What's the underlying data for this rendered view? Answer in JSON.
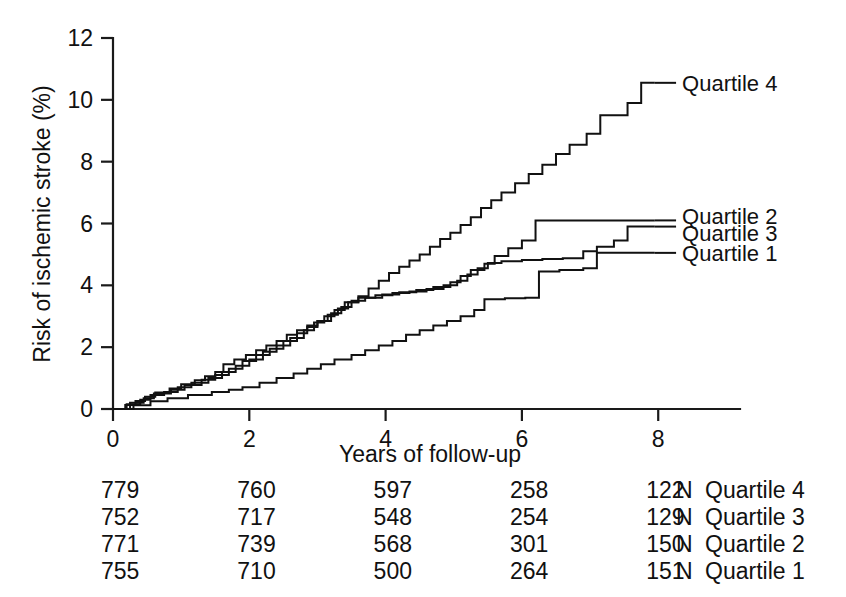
{
  "chart_data": {
    "type": "line",
    "title": "",
    "xlabel": "Years of follow-up",
    "ylabel": "Risk of ischemic stroke (%)",
    "xlim": [
      0,
      9.2
    ],
    "ylim": [
      0,
      12
    ],
    "xticks": [
      0,
      2,
      4,
      6,
      8
    ],
    "xtick_labels": [
      "0",
      "2",
      "4",
      "6",
      "8"
    ],
    "yticks": [
      0,
      2,
      4,
      6,
      8,
      10,
      12
    ],
    "ytick_labels": [
      "0",
      "2",
      "4",
      "6",
      "8",
      "10",
      "12"
    ],
    "grid": false,
    "legend_position": "right-inline",
    "series": [
      {
        "name": "Quartile 4",
        "label": "Quartile 4",
        "label_x": 8.35,
        "label_y": 10.55,
        "points": [
          [
            0.0,
            0.0
          ],
          [
            0.18,
            0.13
          ],
          [
            0.33,
            0.26
          ],
          [
            0.47,
            0.4
          ],
          [
            0.62,
            0.53
          ],
          [
            0.83,
            0.66
          ],
          [
            1.0,
            0.8
          ],
          [
            1.2,
            0.93
          ],
          [
            1.35,
            1.06
          ],
          [
            1.5,
            1.2
          ],
          [
            1.62,
            1.45
          ],
          [
            1.78,
            1.6
          ],
          [
            1.95,
            1.75
          ],
          [
            2.1,
            1.9
          ],
          [
            2.25,
            2.05
          ],
          [
            2.4,
            2.2
          ],
          [
            2.55,
            2.4
          ],
          [
            2.7,
            2.55
          ],
          [
            2.85,
            2.7
          ],
          [
            3.0,
            2.85
          ],
          [
            3.15,
            3.05
          ],
          [
            3.3,
            3.25
          ],
          [
            3.45,
            3.45
          ],
          [
            3.6,
            3.65
          ],
          [
            3.75,
            3.9
          ],
          [
            3.9,
            4.15
          ],
          [
            4.05,
            4.4
          ],
          [
            4.2,
            4.6
          ],
          [
            4.35,
            4.8
          ],
          [
            4.5,
            5.0
          ],
          [
            4.65,
            5.25
          ],
          [
            4.8,
            5.5
          ],
          [
            4.95,
            5.7
          ],
          [
            5.1,
            5.95
          ],
          [
            5.25,
            6.2
          ],
          [
            5.4,
            6.5
          ],
          [
            5.55,
            6.75
          ],
          [
            5.7,
            7.0
          ],
          [
            5.9,
            7.3
          ],
          [
            6.1,
            7.6
          ],
          [
            6.3,
            7.9
          ],
          [
            6.5,
            8.25
          ],
          [
            6.7,
            8.55
          ],
          [
            6.95,
            8.9
          ],
          [
            7.15,
            9.5
          ],
          [
            7.55,
            9.9
          ],
          [
            7.75,
            10.55
          ],
          [
            7.95,
            10.55
          ]
        ]
      },
      {
        "name": "Quartile 2",
        "label": "Quartile 2",
        "label_x": 8.35,
        "label_y": 6.25,
        "points": [
          [
            0.0,
            0.0
          ],
          [
            0.25,
            0.2
          ],
          [
            0.45,
            0.35
          ],
          [
            0.6,
            0.5
          ],
          [
            0.85,
            0.62
          ],
          [
            1.05,
            0.78
          ],
          [
            1.3,
            0.95
          ],
          [
            1.5,
            1.1
          ],
          [
            1.7,
            1.3
          ],
          [
            1.9,
            1.55
          ],
          [
            2.1,
            1.75
          ],
          [
            2.3,
            1.95
          ],
          [
            2.5,
            2.2
          ],
          [
            2.7,
            2.45
          ],
          [
            2.85,
            2.65
          ],
          [
            3.0,
            2.85
          ],
          [
            3.2,
            3.1
          ],
          [
            3.35,
            3.3
          ],
          [
            3.5,
            3.5
          ],
          [
            3.7,
            3.6
          ],
          [
            3.95,
            3.7
          ],
          [
            4.2,
            3.78
          ],
          [
            4.45,
            3.85
          ],
          [
            4.7,
            3.95
          ],
          [
            4.95,
            4.1
          ],
          [
            5.1,
            4.3
          ],
          [
            5.25,
            4.5
          ],
          [
            5.45,
            4.7
          ],
          [
            5.6,
            4.95
          ],
          [
            5.8,
            5.2
          ],
          [
            6.0,
            5.45
          ],
          [
            6.2,
            6.1
          ],
          [
            6.5,
            6.1
          ],
          [
            7.0,
            6.1
          ],
          [
            7.6,
            6.1
          ],
          [
            7.95,
            6.1
          ]
        ]
      },
      {
        "name": "Quartile 3",
        "label": "Quartile 3",
        "label_x": 8.35,
        "label_y": 5.7,
        "points": [
          [
            0.0,
            0.0
          ],
          [
            0.2,
            0.15
          ],
          [
            0.4,
            0.3
          ],
          [
            0.55,
            0.45
          ],
          [
            0.75,
            0.55
          ],
          [
            0.95,
            0.7
          ],
          [
            1.15,
            0.85
          ],
          [
            1.4,
            1.0
          ],
          [
            1.6,
            1.2
          ],
          [
            1.8,
            1.4
          ],
          [
            2.0,
            1.6
          ],
          [
            2.2,
            1.85
          ],
          [
            2.4,
            2.05
          ],
          [
            2.6,
            2.3
          ],
          [
            2.8,
            2.55
          ],
          [
            2.95,
            2.8
          ],
          [
            3.1,
            3.0
          ],
          [
            3.25,
            3.2
          ],
          [
            3.4,
            3.45
          ],
          [
            3.6,
            3.6
          ],
          [
            3.85,
            3.68
          ],
          [
            4.1,
            3.75
          ],
          [
            4.35,
            3.8
          ],
          [
            4.6,
            3.88
          ],
          [
            4.85,
            4.0
          ],
          [
            5.05,
            4.15
          ],
          [
            5.2,
            4.35
          ],
          [
            5.35,
            4.55
          ],
          [
            5.5,
            4.72
          ],
          [
            5.7,
            4.78
          ],
          [
            6.0,
            4.82
          ],
          [
            6.3,
            4.85
          ],
          [
            6.6,
            4.88
          ],
          [
            6.9,
            5.1
          ],
          [
            7.1,
            5.25
          ],
          [
            7.35,
            5.45
          ],
          [
            7.55,
            5.9
          ],
          [
            7.95,
            5.9
          ]
        ]
      },
      {
        "name": "Quartile 1",
        "label": "Quartile 1",
        "label_x": 8.35,
        "label_y": 5.05,
        "points": [
          [
            0.0,
            0.0
          ],
          [
            0.3,
            0.12
          ],
          [
            0.55,
            0.25
          ],
          [
            0.8,
            0.35
          ],
          [
            1.1,
            0.45
          ],
          [
            1.45,
            0.55
          ],
          [
            1.7,
            0.62
          ],
          [
            1.9,
            0.7
          ],
          [
            2.15,
            0.85
          ],
          [
            2.4,
            1.0
          ],
          [
            2.65,
            1.15
          ],
          [
            2.85,
            1.3
          ],
          [
            3.05,
            1.45
          ],
          [
            3.25,
            1.6
          ],
          [
            3.5,
            1.75
          ],
          [
            3.7,
            1.9
          ],
          [
            3.9,
            2.05
          ],
          [
            4.1,
            2.2
          ],
          [
            4.3,
            2.4
          ],
          [
            4.5,
            2.55
          ],
          [
            4.7,
            2.7
          ],
          [
            4.9,
            2.85
          ],
          [
            5.1,
            3.0
          ],
          [
            5.3,
            3.2
          ],
          [
            5.45,
            3.55
          ],
          [
            5.75,
            3.58
          ],
          [
            6.05,
            3.6
          ],
          [
            6.25,
            4.45
          ],
          [
            6.55,
            4.5
          ],
          [
            6.9,
            4.55
          ],
          [
            7.1,
            5.05
          ],
          [
            7.5,
            5.05
          ],
          [
            7.95,
            5.05
          ]
        ]
      }
    ]
  },
  "risk_table": {
    "n_header": "N",
    "column_x": [
      0,
      2,
      4,
      6,
      8
    ],
    "rows": [
      {
        "label": "Quartile 4",
        "n_label": "N",
        "counts": [
          "779",
          "760",
          "597",
          "258",
          "122"
        ]
      },
      {
        "label": "Quartile 3",
        "n_label": "N",
        "counts": [
          "752",
          "717",
          "548",
          "254",
          "129"
        ]
      },
      {
        "label": "Quartile 2",
        "n_label": "N",
        "counts": [
          "771",
          "739",
          "568",
          "301",
          "150"
        ]
      },
      {
        "label": "Quartile 1",
        "n_label": "N",
        "counts": [
          "755",
          "710",
          "500",
          "264",
          "151"
        ]
      }
    ]
  },
  "colors": {
    "curve": "#111111",
    "axis": "#1a1a1a",
    "background": "#ffffff"
  }
}
